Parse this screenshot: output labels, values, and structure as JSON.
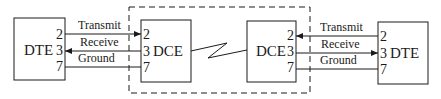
{
  "diagram": {
    "title": "",
    "left_dte": {
      "label": "DTE",
      "pins": [
        "2",
        "3",
        "7"
      ]
    },
    "left_dce": {
      "label": "DCE",
      "pins": [
        "2",
        "3",
        "7"
      ]
    },
    "right_dce": {
      "label": "DCE",
      "pins": [
        "2",
        "3",
        "7"
      ]
    },
    "right_dte": {
      "label": "DTE",
      "pins": [
        "2",
        "3",
        "7"
      ]
    },
    "left_links": [
      {
        "label": "Transmit",
        "from": "DTE pin 2",
        "to": "DCE pin 2",
        "arrow": "right"
      },
      {
        "label": "Receive",
        "from": "DCE pin 3",
        "to": "DTE pin 3",
        "arrow": "left"
      },
      {
        "label": "Ground",
        "from": "DTE pin 7",
        "to": "DCE pin 7",
        "arrow": "none"
      }
    ],
    "right_links": [
      {
        "label": "Transmit",
        "from": "DTE pin 2",
        "to": "DCE pin 2",
        "arrow": "left"
      },
      {
        "label": "Receive",
        "from": "DCE pin 3",
        "to": "DTE pin 3",
        "arrow": "right"
      },
      {
        "label": "Ground",
        "from": "DTE pin 7",
        "to": "DCE pin 7",
        "arrow": "none"
      }
    ],
    "middle_link": {
      "type": "lightning-zigzag"
    },
    "boundary": {
      "style": "dashed",
      "encloses": [
        "left_dce",
        "right_dce"
      ]
    },
    "colors": {
      "line": "#1a1a1a",
      "background": "#ffffff"
    }
  }
}
